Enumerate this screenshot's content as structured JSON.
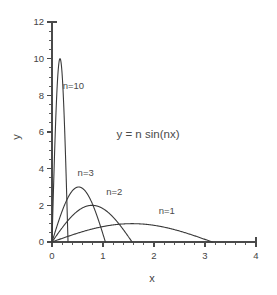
{
  "chart_data": {
    "type": "line",
    "title": "",
    "subtitle": "",
    "equation_annotation": "y = n sin(nx)",
    "xlabel": "x",
    "ylabel": "y",
    "xlim": [
      0,
      4
    ],
    "ylim": [
      0,
      12
    ],
    "xticks": [
      0,
      1,
      2,
      3,
      4
    ],
    "xticklabels": [
      "0",
      "1",
      "2",
      "3",
      "4"
    ],
    "xminor_step": 0.2,
    "yticks": [
      0,
      2,
      4,
      6,
      8,
      10,
      12
    ],
    "yticklabels": [
      "0",
      "2",
      "4",
      "6",
      "8",
      "10",
      "12"
    ],
    "yminor_step": 0.5,
    "grid": false,
    "legend": "inline-curve-labels",
    "line_color": "#3a3a3a",
    "axis_color": "#4a4a4a",
    "background": "#ffffff",
    "series": [
      {
        "name": "n=1",
        "n": 1,
        "label": "n=1",
        "label_x": 2.25,
        "label_y": 1.55,
        "peak_x": 1.571,
        "peak_y": 1,
        "zero_crossing_x": 3.142,
        "values_at": {
          "x": [
            0,
            0.2,
            0.4,
            0.6,
            0.8,
            1.0,
            1.2,
            1.4,
            1.571,
            1.8,
            2.0,
            2.2,
            2.4,
            2.6,
            2.8,
            3.0,
            3.142
          ],
          "y": [
            0,
            0.199,
            0.389,
            0.565,
            0.717,
            0.841,
            0.932,
            0.985,
            1.0,
            0.974,
            0.909,
            0.808,
            0.675,
            0.516,
            0.335,
            0.141,
            0
          ]
        }
      },
      {
        "name": "n=2",
        "n": 2,
        "label": "n=2",
        "label_x": 1.22,
        "label_y": 2.55,
        "peak_x": 0.785,
        "peak_y": 2,
        "zero_crossing_x": 1.571,
        "values_at": {
          "x": [
            0,
            0.1,
            0.2,
            0.3,
            0.4,
            0.5,
            0.6,
            0.7,
            0.785,
            0.9,
            1.0,
            1.1,
            1.2,
            1.3,
            1.4,
            1.5,
            1.571
          ],
          "y": [
            0,
            0.397,
            0.779,
            1.129,
            1.435,
            1.683,
            1.865,
            1.974,
            2.0,
            1.948,
            1.819,
            1.62,
            1.36,
            1.052,
            0.711,
            0.353,
            0
          ]
        }
      },
      {
        "name": "n=3",
        "n": 3,
        "label": "n=3",
        "label_x": 0.66,
        "label_y": 3.6,
        "peak_x": 0.524,
        "peak_y": 3,
        "zero_crossing_x": 1.047,
        "values_at": {
          "x": [
            0,
            0.08,
            0.16,
            0.24,
            0.32,
            0.4,
            0.48,
            0.524,
            0.6,
            0.68,
            0.76,
            0.84,
            0.92,
            1.0,
            1.047
          ],
          "y": [
            0,
            0.709,
            1.38,
            1.98,
            2.48,
            2.83,
            2.99,
            3.0,
            2.93,
            2.7,
            2.31,
            1.8,
            1.18,
            0.42,
            0
          ]
        }
      },
      {
        "name": "n=10",
        "n": 10,
        "label": "n=10",
        "label_x": 0.42,
        "label_y": 8.35,
        "peak_x": 0.157,
        "peak_y": 10,
        "zero_crossing_x": 0.314,
        "values_at": {
          "x": [
            0,
            0.03,
            0.06,
            0.09,
            0.12,
            0.157,
            0.19,
            0.22,
            0.25,
            0.28,
            0.314
          ],
          "y": [
            0,
            2.96,
            5.65,
            7.83,
            9.32,
            10.0,
            9.75,
            8.94,
            7.07,
            5.06,
            0
          ]
        }
      }
    ]
  }
}
